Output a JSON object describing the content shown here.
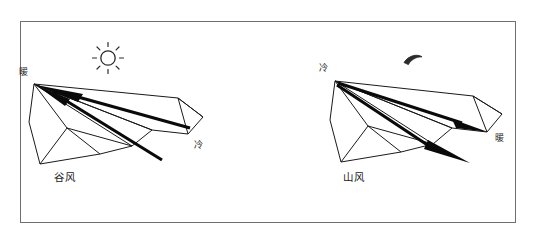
{
  "figure": {
    "type": "diagram",
    "frame_color": "#6f6f6f",
    "ink_color": "#1a1a1a",
    "background": "#ffffff"
  },
  "panels": [
    {
      "id": "daytime",
      "name": "valley-wind-panel",
      "wind_name": "谷风",
      "sky_icon": "sun-icon",
      "labels": [
        {
          "name": "peak-temperature-label",
          "text": "暖",
          "x": 19,
          "y": 68
        },
        {
          "name": "valley-temperature-label",
          "text": "冷",
          "x": 194,
          "y": 141
        },
        {
          "name": "wind-name-label",
          "text": "谷风",
          "x": 54,
          "y": 172
        }
      ],
      "arrow_direction": "up-slope toward peak (left)"
    },
    {
      "id": "nighttime",
      "name": "mountain-wind-panel",
      "wind_name": "山风",
      "sky_icon": "crescent-moon-icon",
      "labels": [
        {
          "name": "peak-temperature-label",
          "text": "冷",
          "x": 319,
          "y": 64
        },
        {
          "name": "valley-temperature-label",
          "text": "暖",
          "x": 495,
          "y": 134
        },
        {
          "name": "wind-name-label",
          "text": "山风",
          "x": 343,
          "y": 172
        }
      ],
      "arrow_direction": "down-slope away from peak (right)"
    }
  ]
}
